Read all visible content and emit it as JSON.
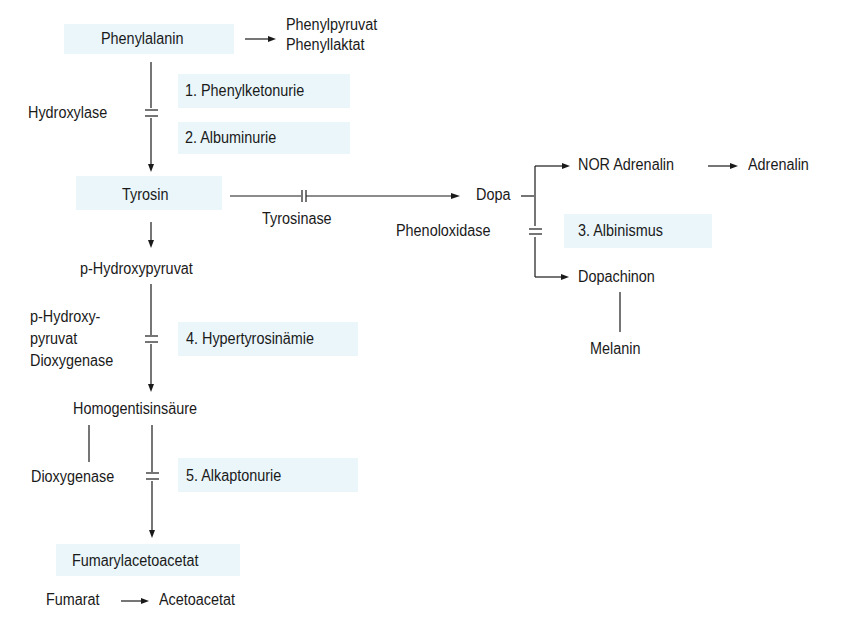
{
  "diagram": {
    "main_pathway": {
      "phenylalanin": "Phenylalanin",
      "side_products": [
        "Phenylpyruvat",
        "Phenyllaktat"
      ],
      "enzyme_hydroxylase": "Hydroxylase",
      "tyrosin": "Tyrosin",
      "p_hydroxypyruvat": "p-Hydroxypyruvat",
      "enzyme_p_hydroxypyruvat_dioxygenase": [
        "p-Hydroxy-",
        "pyruvat",
        "Dioxygenase"
      ],
      "homogentisinsaeure": "Homogentisinsäure",
      "enzyme_dioxygenase": "Dioxygenase",
      "fumarylacetoacetat": "Fumarylacetoacetat",
      "fumarat": "Fumarat",
      "acetoacetat": "Acetoacetat"
    },
    "branch": {
      "enzyme_tyrosinase": "Tyrosinase",
      "dopa": "Dopa",
      "nor_adrenalin": "NOR Adrenalin",
      "adrenalin": "Adrenalin",
      "enzyme_phenoloxidase": "Phenoloxidase",
      "dopachinon": "Dopachinon",
      "melanin": "Melanin"
    },
    "disorders": [
      {
        "label": "1. Phenylketonurie"
      },
      {
        "label": "2. Albuminurie"
      },
      {
        "label": "3. Albinismus"
      },
      {
        "label": "4. Hypertyrosinämie"
      },
      {
        "label": "5. Alkaptonurie"
      }
    ],
    "colors": {
      "highlight": "#eaf6fa",
      "line": "#1a1a1a"
    }
  }
}
